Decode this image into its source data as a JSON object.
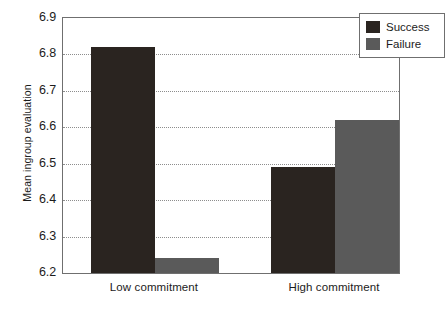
{
  "chart_data": {
    "type": "bar",
    "title": "",
    "subtitle": "",
    "xlabel": "",
    "ylabel": "Mean ingroup evaluation",
    "categories": [
      "Low commitment",
      "High commitment"
    ],
    "series": [
      {
        "name": "Success",
        "color": "#2a2420",
        "values": [
          6.82,
          6.49
        ]
      },
      {
        "name": "Failure",
        "color": "#5a5a5a",
        "values": [
          6.24,
          6.62
        ]
      }
    ],
    "ylim": [
      6.2,
      6.9
    ],
    "ytick_labels": [
      "6.9",
      "6.8",
      "6.7",
      "6.6",
      "6.5",
      "6.4",
      "6.3",
      "6.2"
    ],
    "ytick_values": [
      6.9,
      6.8,
      6.7,
      6.6,
      6.5,
      6.4,
      6.3,
      6.2
    ],
    "ytick_step": 0.1,
    "grid": true,
    "grid_style": "dotted",
    "grid_color": "#8d8d8d",
    "legend_position": "top-right",
    "legend_entries": [
      "Success",
      "Failure"
    ],
    "axis_color": "#6f6f6f",
    "background": "#ffffff"
  }
}
